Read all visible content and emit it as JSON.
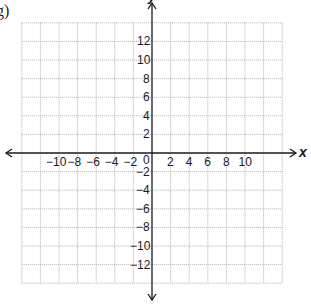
{
  "figure": {
    "part_label": "g)",
    "x_axis_label": "x",
    "y_axis_label": "y"
  },
  "grid": {
    "x_min": -14,
    "x_max": 14,
    "y_min": -14,
    "y_max": 14,
    "step": 2,
    "origin_px": [
      152,
      153
    ],
    "unit_px": 9.3,
    "line_color": "#b0b0b0",
    "axis_color": "#1a1a1a"
  },
  "ticks": {
    "origin": "0",
    "x_positive": [
      "2",
      "4",
      "6",
      "8",
      "10"
    ],
    "x_negative": [
      "−2",
      "−4",
      "−6",
      "−8",
      "−10"
    ],
    "y_positive": [
      "2",
      "4",
      "6",
      "8",
      "10",
      "12"
    ],
    "y_negative": [
      "−2",
      "−4",
      "−6",
      "−8",
      "−10",
      "−12"
    ]
  }
}
